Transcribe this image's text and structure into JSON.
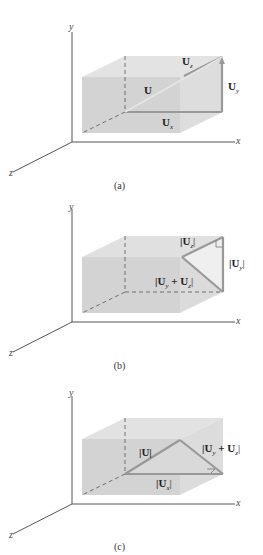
{
  "panels": [
    {
      "id": "a",
      "caption": "(a)",
      "axes": {
        "x": "x",
        "y": "y",
        "z": "z"
      },
      "labels": {
        "U": "U",
        "Uz": "U",
        "Uz_sub": "z",
        "Uy": "U",
        "Uy_sub": "y",
        "Ux": "U",
        "Ux_sub": "x"
      }
    },
    {
      "id": "b",
      "caption": "(b)",
      "axes": {
        "x": "x",
        "y": "y",
        "z": "z"
      },
      "labels": {
        "Uz_mag": "|U",
        "Uz_sub": "z",
        "Uz_close": "|",
        "Uy_mag": "|U",
        "Uy_sub": "y",
        "Uy_close": "|",
        "sum_open": "|U",
        "sum_sub1": "y",
        "sum_plus": " + U",
        "sum_sub2": "z",
        "sum_close": "|"
      }
    },
    {
      "id": "c",
      "caption": "(c)",
      "axes": {
        "x": "x",
        "y": "y",
        "z": "z"
      },
      "labels": {
        "U_mag": "|U|",
        "Ux_mag": "|U",
        "Ux_sub": "x",
        "Ux_close": "|",
        "sum_open": "|U",
        "sum_sub1": "y",
        "sum_plus": " + U",
        "sum_sub2": "z",
        "sum_close": "|"
      }
    }
  ],
  "colors": {
    "box_front": "#d4d4d4",
    "box_top": "#e2e2e2",
    "box_side": "#dcdcdc",
    "vector": "#9a9a9a",
    "axis": "#555555",
    "triangle_fill": "#ececec"
  }
}
